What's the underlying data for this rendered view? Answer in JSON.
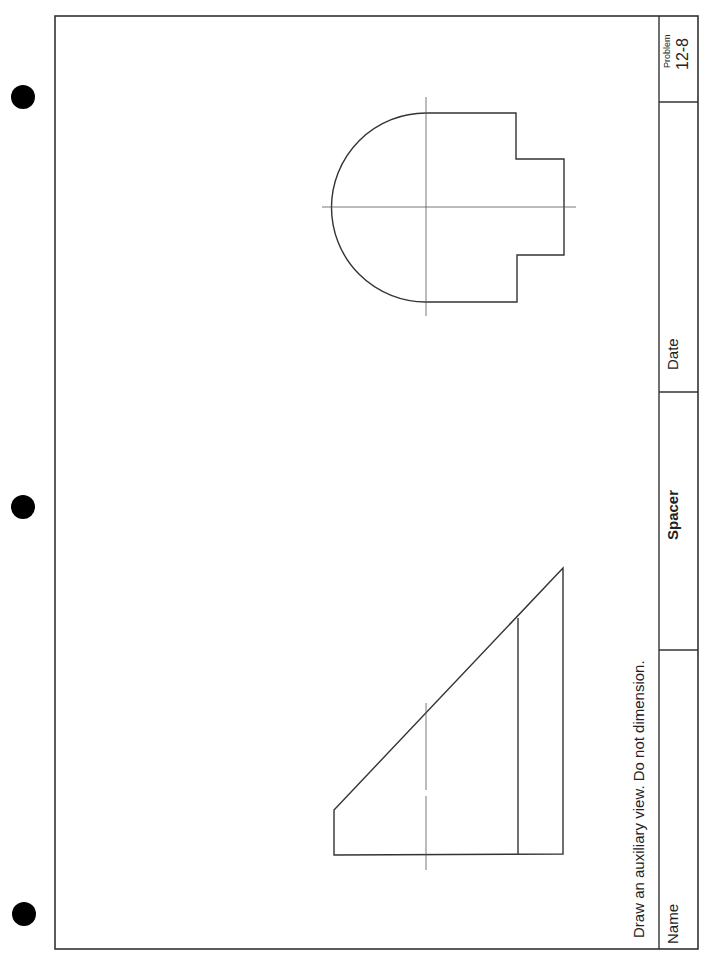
{
  "sheet": {
    "instruction": "Draw an auxiliary view. Do not dimension.",
    "title_block": {
      "name_label": "Name",
      "part_name": "Spacer",
      "date_label": "Date",
      "problem_label": "Problem",
      "problem_number": "12-8"
    },
    "binder_holes": 3,
    "colors": {
      "line": "#333333",
      "centerline": "#555555",
      "hole": "#000000"
    }
  }
}
